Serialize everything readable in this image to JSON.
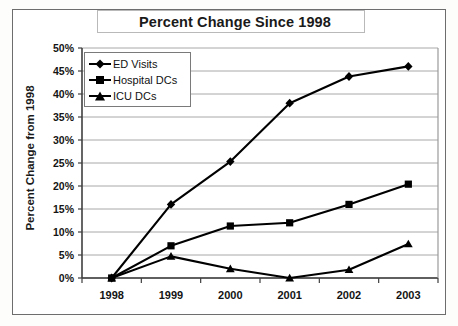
{
  "chart_data": {
    "type": "line",
    "title": "Percent Change Since 1998",
    "xlabel": "",
    "ylabel": "Percent Change from 1998",
    "categories": [
      "1998",
      "1999",
      "2000",
      "2001",
      "2002",
      "2003"
    ],
    "x": [
      1998,
      1999,
      2000,
      2001,
      2002,
      2003
    ],
    "ylim": [
      0,
      50
    ],
    "yticks": [
      "0%",
      "5%",
      "10%",
      "15%",
      "20%",
      "25%",
      "30%",
      "35%",
      "40%",
      "45%",
      "50%"
    ],
    "ytick_values": [
      0,
      5,
      10,
      15,
      20,
      25,
      30,
      35,
      40,
      45,
      50
    ],
    "grid": true,
    "legend_position": "upper-left-inside",
    "series": [
      {
        "name": "ED Visits",
        "marker": "diamond",
        "values": [
          0,
          16,
          25.3,
          38,
          43.8,
          46
        ]
      },
      {
        "name": "Hospital DCs",
        "marker": "square",
        "values": [
          0,
          7,
          11.3,
          12,
          16,
          20.4
        ]
      },
      {
        "name": "ICU DCs",
        "marker": "triangle",
        "values": [
          0,
          4.7,
          2,
          0,
          1.8,
          7.4
        ]
      }
    ],
    "colors": {
      "line": "#000000",
      "grid": "#a8a8a8",
      "axis": "#4d4d4d",
      "background": "#ffffff"
    }
  }
}
